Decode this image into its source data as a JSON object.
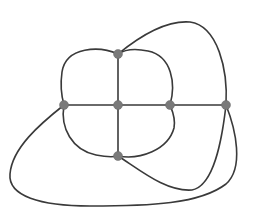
{
  "diagram": {
    "type": "planar-graph",
    "background": "#ffffff",
    "edge_color": "#3a3a3a",
    "node_color": "#7a7a7a",
    "nodes": [
      {
        "id": "top",
        "x": 118,
        "y": 54
      },
      {
        "id": "left",
        "x": 64,
        "y": 105
      },
      {
        "id": "center",
        "x": 118,
        "y": 105
      },
      {
        "id": "right-inner",
        "x": 170,
        "y": 105
      },
      {
        "id": "right-outer",
        "x": 226,
        "y": 105
      },
      {
        "id": "bottom",
        "x": 118,
        "y": 156
      }
    ],
    "edges": [
      {
        "id": "top-center",
        "from": "top",
        "to": "center",
        "path": "M118 54 L118 105"
      },
      {
        "id": "center-bottom",
        "from": "center",
        "to": "bottom",
        "path": "M118 105 L118 156"
      },
      {
        "id": "left-center",
        "from": "left",
        "to": "center",
        "path": "M64 105 L118 105"
      },
      {
        "id": "center-right-inner",
        "from": "center",
        "to": "right-inner",
        "path": "M118 105 L170 105"
      },
      {
        "id": "right-inner-right-outer",
        "from": "right-inner",
        "to": "right-outer",
        "path": "M170 105 L226 105"
      },
      {
        "id": "top-left-arc",
        "from": "top",
        "to": "left",
        "path": "M118 54 C100 46 66 46 62 72 C60 86 62 98 64 105"
      },
      {
        "id": "left-bottom-arc",
        "from": "left",
        "to": "bottom",
        "path": "M64 105 C60 128 72 150 96 155 C106 157 114 157 118 156"
      },
      {
        "id": "bottom-right-inner-arc",
        "from": "bottom",
        "to": "right-inner",
        "path": "M118 156 C140 160 168 150 174 128 C176 118 172 110 170 105"
      },
      {
        "id": "right-inner-top-arc",
        "from": "right-inner",
        "to": "top",
        "path": "M170 105 C176 84 172 56 148 51 C134 48 124 50 118 54"
      },
      {
        "id": "top-right-outer-arc",
        "from": "top",
        "to": "right-outer",
        "path": "M118 54 C140 36 166 20 190 22 C218 26 228 70 226 105"
      },
      {
        "id": "left-right-outer-loop",
        "from": "left",
        "to": "right-outer",
        "path": "M64 105 C40 124 12 148 10 174 C8 196 40 206 90 206 C150 206 200 204 226 184 C244 168 236 130 226 105"
      },
      {
        "id": "bottom-right-outer-arc",
        "from": "bottom",
        "to": "right-outer",
        "path": "M118 156 C140 170 166 192 192 190 C214 186 222 140 226 105"
      }
    ]
  }
}
